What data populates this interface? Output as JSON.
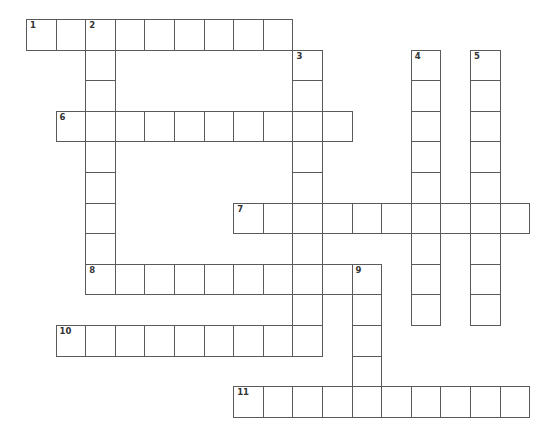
{
  "puzzle": {
    "grid_origin": {
      "x": 26,
      "y": 19
    },
    "cell_width": 29.6,
    "cell_height": 30.6,
    "line_color": "#5a5a5a",
    "background_color": "#ffffff",
    "words": [
      {
        "number": "1",
        "direction": "across",
        "row": 0,
        "col": 0,
        "length": 9
      },
      {
        "number": "2",
        "direction": "down",
        "row": 0,
        "col": 2,
        "length": 9
      },
      {
        "number": "3",
        "direction": "down",
        "row": 1,
        "col": 9,
        "length": 10
      },
      {
        "number": "4",
        "direction": "down",
        "row": 1,
        "col": 13,
        "length": 9
      },
      {
        "number": "5",
        "direction": "down",
        "row": 1,
        "col": 15,
        "length": 9
      },
      {
        "number": "6",
        "direction": "across",
        "row": 3,
        "col": 1,
        "length": 10
      },
      {
        "number": "7",
        "direction": "across",
        "row": 6,
        "col": 7,
        "length": 10
      },
      {
        "number": "8",
        "direction": "across",
        "row": 8,
        "col": 2,
        "length": 10
      },
      {
        "number": "9",
        "direction": "down",
        "row": 8,
        "col": 11,
        "length": 5
      },
      {
        "number": "10",
        "direction": "across",
        "row": 10,
        "col": 1,
        "length": 9
      },
      {
        "number": "11",
        "direction": "across",
        "row": 12,
        "col": 7,
        "length": 10
      }
    ]
  }
}
